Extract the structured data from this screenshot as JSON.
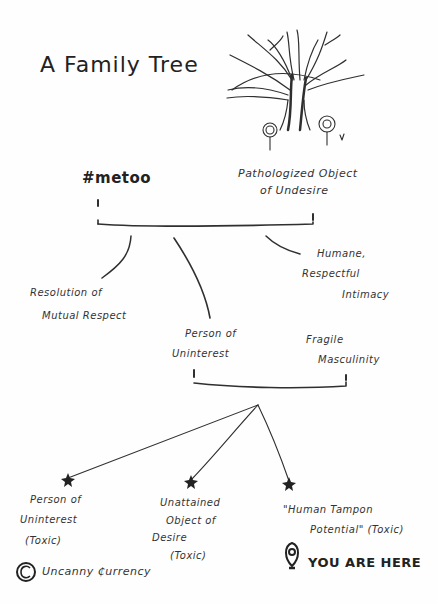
{
  "title": "A Family Tree",
  "colors": {
    "ink": "#2a2a2a",
    "background": "#fefefe"
  },
  "generation1": {
    "left": {
      "label": "#metoo"
    },
    "right": {
      "label_line1": "Pathologized Object",
      "label_line2": "of Undesire"
    }
  },
  "generation2": {
    "children": [
      {
        "line1": "Resolution of",
        "line2": "Mutual Respect"
      },
      {
        "line1": "Person of",
        "line2": "Uninterest"
      },
      {
        "line1": "Humane,",
        "line2": "Respectful",
        "line3": "Intimacy"
      }
    ],
    "partner": {
      "line1": "Fragile",
      "line2": "Masculinity"
    }
  },
  "generation3": {
    "children": [
      {
        "line1": "Person of",
        "line2": "Uninterest",
        "line3": "(Toxic)"
      },
      {
        "line1": "Unattained",
        "line2": "Object of",
        "line3": "Desire",
        "line4": "(Toxic)"
      },
      {
        "line1": "\"Human Tampon",
        "line2": "Potential\" (Toxic)"
      }
    ]
  },
  "marker": {
    "icon": "location-pin-icon",
    "label": "YOU ARE HERE"
  },
  "credit": {
    "symbol": "©",
    "label": "Uncanny ₵urrency"
  }
}
